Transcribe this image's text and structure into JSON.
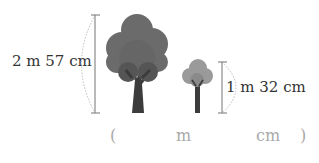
{
  "tall_tree": {
    "height_label": "2 m  57 cm"
  },
  "short_tree": {
    "height_label": "1 m  32 cm"
  },
  "answer": {
    "open_paren": "(",
    "meter_unit": "m",
    "centimeter_unit": "cm",
    "close_paren": ")"
  },
  "colors": {
    "tall_canopy": "#6b6b6b",
    "short_canopy": "#9a9a9a",
    "trunk": "#3c3c3c",
    "measure_line": "#8a8a8a",
    "answer_text": "#aaaaaa"
  }
}
